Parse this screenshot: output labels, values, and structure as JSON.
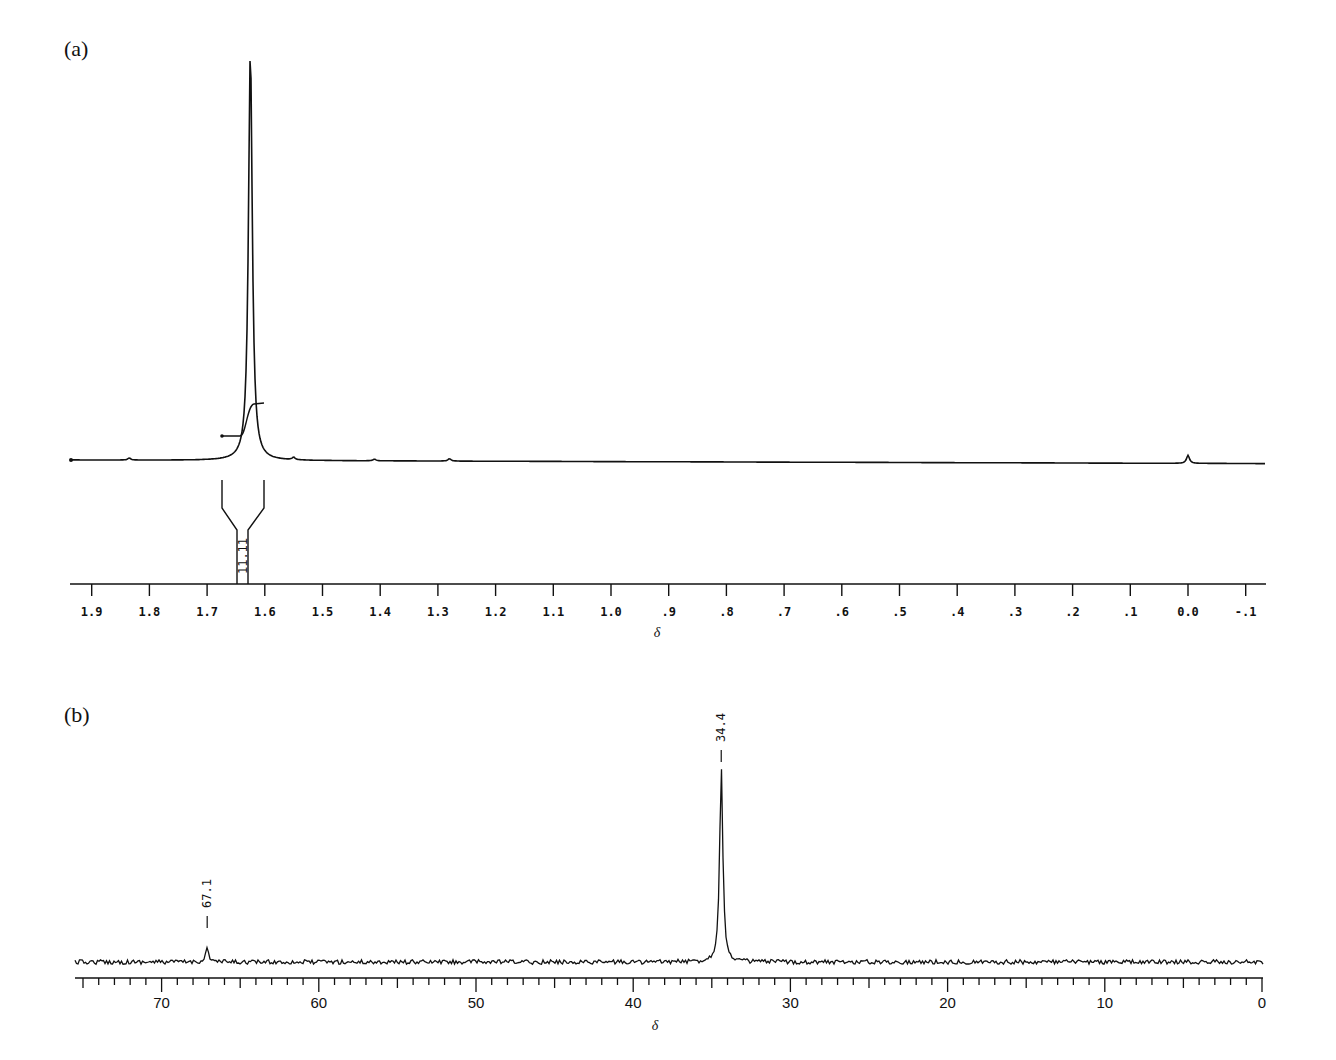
{
  "chart_data": [
    {
      "panel": "(a)",
      "type": "line",
      "title": "",
      "xlabel": "δ",
      "ylabel": "",
      "xlim": [
        1.93,
        -0.13
      ],
      "x_axis_reversed": true,
      "ticks": [
        "1.9",
        "1.8",
        "1.7",
        "1.6",
        "1.5",
        "1.4",
        "1.3",
        "1.2",
        "1.1",
        "1.0",
        ".9",
        ".8",
        ".7",
        ".6",
        ".5",
        ".4",
        ".3",
        ".2",
        ".1",
        "0.0",
        "-.1"
      ],
      "tick_values": [
        1.9,
        1.8,
        1.7,
        1.6,
        1.5,
        1.4,
        1.3,
        1.2,
        1.1,
        1.0,
        0.9,
        0.8,
        0.7,
        0.6,
        0.5,
        0.4,
        0.3,
        0.2,
        0.1,
        0.0,
        -0.1
      ],
      "peaks": [
        {
          "shift": 1.625,
          "relative_height": 1.0
        },
        {
          "shift": 1.835,
          "relative_height": 0.005
        },
        {
          "shift": 1.55,
          "relative_height": 0.006
        },
        {
          "shift": 1.41,
          "relative_height": 0.004
        },
        {
          "shift": 1.28,
          "relative_height": 0.006
        },
        {
          "shift": 0.0,
          "relative_height": 0.02
        }
      ],
      "integration": {
        "region": [
          1.67,
          1.6
        ],
        "value": "11.11"
      },
      "grid": false
    },
    {
      "panel": "(b)",
      "type": "line",
      "title": "",
      "xlabel": "δ",
      "ylabel": "",
      "xlim": [
        75.5,
        -0.5
      ],
      "x_axis_reversed": true,
      "ticks": [
        "70",
        "60",
        "50",
        "40",
        "30",
        "20",
        "10",
        "0"
      ],
      "tick_values": [
        70,
        60,
        50,
        40,
        30,
        20,
        10,
        0
      ],
      "peaks": [
        {
          "shift": 67.1,
          "label": "67.1",
          "relative_height": 0.07
        },
        {
          "shift": 34.4,
          "label": "34.4",
          "relative_height": 1.0
        }
      ],
      "grid": false
    }
  ],
  "panels": {
    "a": {
      "label": "(a)",
      "xlabel": "δ",
      "integral_value": "11.11"
    },
    "b": {
      "label": "(b)",
      "xlabel": "δ",
      "peak_labels": [
        "67.1",
        "34.4"
      ]
    }
  }
}
